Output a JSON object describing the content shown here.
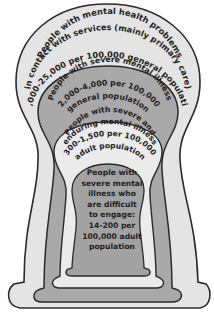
{
  "diagram": {
    "type": "nested-layers",
    "colors": {
      "outline": "#2a2a2a",
      "level1_fill": "#e4e4e4",
      "level2_fill": "#a9a9a9",
      "level3_fill": "#ebebeb",
      "level4_fill": "#a2a2a2",
      "text": "#1e1e1e"
    },
    "levels": [
      {
        "lines": [
          "People with mental health problems",
          "in contact with services (mainly primary care)",
          "10,000-25,000 per 100,000 general population"
        ]
      },
      {
        "lines": [
          "People with severe mental illness",
          "2,000-4,000 per 100,000",
          "general population"
        ]
      },
      {
        "lines": [
          "People with severe and",
          "enduring mental illness",
          "300-1,500 per 100,000",
          "adult population"
        ]
      },
      {
        "lines": [
          "People with",
          "severe mental",
          "illness who",
          "are difficult",
          "to engage:",
          "14-200 per",
          "100,000 adult",
          "population"
        ]
      }
    ]
  }
}
